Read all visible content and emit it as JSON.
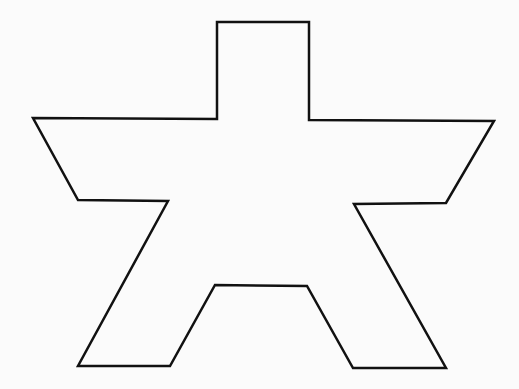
{
  "diagram": {
    "type": "polygon-outline",
    "shape": "star-like cross polygon",
    "stroke_color": "#111111",
    "fill_color": "#fbfbfb",
    "stroke_width": 2.5,
    "points": "217,22 309,22 309,120 494,121 446,203 354,204 446,368 353,368 307,286 215,285 170,366 78,366 168,201 78,200 33,118 217,119"
  }
}
